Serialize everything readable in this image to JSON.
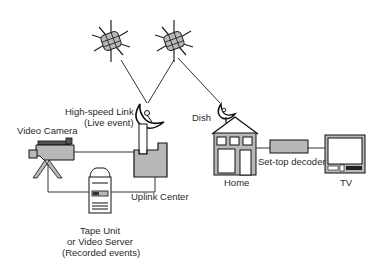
{
  "diagram": {
    "type": "satellite broadcast network",
    "nodes": {
      "satellite_1": {
        "label": ""
      },
      "satellite_2": {
        "label": ""
      },
      "uplink_dish": {
        "label_line1": "High-speed Link",
        "label_line2": "(Live event)"
      },
      "video_camera": {
        "label": "Video Camera"
      },
      "uplink_center": {
        "label": "Uplink Center"
      },
      "tape_unit": {
        "label_line1": "Tape Unit",
        "label_line2": "or Video Server",
        "label_line3": "(Recorded events)"
      },
      "home_dish": {
        "label": "Dish"
      },
      "home": {
        "label": "Home"
      },
      "set_top_decoder": {
        "label": "Set-top decoder"
      },
      "tv": {
        "label": "TV"
      }
    },
    "edges": [
      {
        "from": "uplink_dish",
        "to": "satellite_1",
        "style": "solid-thin"
      },
      {
        "from": "uplink_dish",
        "to": "satellite_2",
        "style": "solid-thin"
      },
      {
        "from": "satellite_2",
        "to": "home_dish",
        "style": "solid-thin"
      },
      {
        "from": "video_camera",
        "to": "uplink_center",
        "style": "solid"
      },
      {
        "from": "video_camera",
        "to": "tape_unit",
        "style": "solid"
      },
      {
        "from": "tape_unit",
        "to": "uplink_center",
        "style": "solid"
      },
      {
        "from": "home",
        "to": "set_top_decoder",
        "style": "solid"
      },
      {
        "from": "set_top_decoder",
        "to": "tv",
        "style": "solid"
      }
    ],
    "colors": {
      "fill_gray": "#b8b8b8",
      "stroke": "#1a1a1a",
      "text": "#2a2a2a"
    }
  }
}
